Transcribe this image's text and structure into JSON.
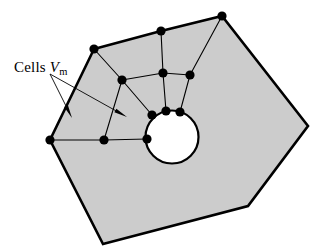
{
  "figure": {
    "background_color": "#ffffff",
    "fill_color": "#cccccc",
    "stroke_color": "#000000",
    "node_color": "#000000",
    "hole_fill_color": "#ffffff",
    "outer_stroke_width": 2.6,
    "inner_stroke_width": 1.1,
    "node_radius": 4.6
  },
  "annotation": {
    "label_prefix": "Cells ",
    "label_variable": "V",
    "label_subscript": "m",
    "label_x": 14,
    "label_y": 60
  },
  "outer_polygon": {
    "name": "domain-boundary",
    "points": "94,49 161,31 222,16 308,126 248,206 103,244 50,140"
  },
  "hole": {
    "name": "circular-hole",
    "cx": 172,
    "cy": 137,
    "r": 26.5
  },
  "mesh_edges": [
    {
      "name": "edge-topleft-to-center",
      "x1": 94,
      "y1": 49,
      "x2": 122,
      "y2": 80
    },
    {
      "name": "edge-topmid-to-hub",
      "x1": 161,
      "y1": 31,
      "x2": 163,
      "y2": 73
    },
    {
      "name": "edge-topright-to-right",
      "x1": 222,
      "y1": 16,
      "x2": 190,
      "y2": 75
    },
    {
      "name": "edge-center-to-hub",
      "x1": 122,
      "y1": 80,
      "x2": 163,
      "y2": 73
    },
    {
      "name": "edge-hub-to-right",
      "x1": 163,
      "y1": 73,
      "x2": 190,
      "y2": 75
    },
    {
      "name": "edge-center-to-holeleft",
      "x1": 122,
      "y1": 80,
      "x2": 152,
      "y2": 115
    },
    {
      "name": "edge-hub-to-holetop",
      "x1": 163,
      "y1": 73,
      "x2": 166,
      "y2": 111
    },
    {
      "name": "edge-right-to-holetopright",
      "x1": 190,
      "y1": 75,
      "x2": 180,
      "y2": 112
    },
    {
      "name": "edge-center-to-lowerleft",
      "x1": 122,
      "y1": 80,
      "x2": 104,
      "y2": 140
    },
    {
      "name": "edge-leftvertex-to-lowerleft",
      "x1": 50,
      "y1": 140,
      "x2": 104,
      "y2": 140
    },
    {
      "name": "edge-lowerleft-to-holeleftlow",
      "x1": 104,
      "y1": 140,
      "x2": 147,
      "y2": 139
    }
  ],
  "nodes": [
    {
      "name": "node-top-left-vertex",
      "cx": 94,
      "cy": 49
    },
    {
      "name": "node-top-mid-vertex",
      "cx": 161,
      "cy": 31
    },
    {
      "name": "node-top-right-vertex",
      "cx": 222,
      "cy": 16
    },
    {
      "name": "node-left-vertex",
      "cx": 50,
      "cy": 140
    },
    {
      "name": "node-interior-center",
      "cx": 122,
      "cy": 80
    },
    {
      "name": "node-interior-hub",
      "cx": 163,
      "cy": 73
    },
    {
      "name": "node-interior-right",
      "cx": 190,
      "cy": 75
    },
    {
      "name": "node-lower-left",
      "cx": 104,
      "cy": 140
    },
    {
      "name": "node-hole-upper-left",
      "cx": 152,
      "cy": 115
    },
    {
      "name": "node-hole-top",
      "cx": 166,
      "cy": 111
    },
    {
      "name": "node-hole-top-right",
      "cx": 180,
      "cy": 112
    },
    {
      "name": "node-hole-left",
      "cx": 147,
      "cy": 139
    }
  ],
  "leader_arrows": [
    {
      "name": "leader-arrow-left",
      "x1": 50,
      "y1": 74,
      "x2": 72,
      "y2": 118,
      "head_size": 7
    },
    {
      "name": "leader-arrow-right",
      "x1": 50,
      "y1": 74,
      "x2": 127,
      "y2": 117,
      "head_size": 7
    }
  ]
}
